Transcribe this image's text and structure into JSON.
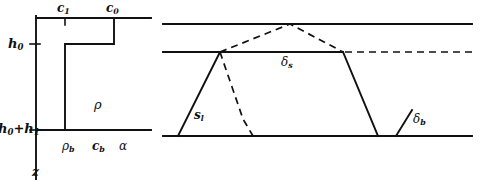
{
  "figure": {
    "kind": "scientific-line-diagram",
    "background_color": "#ffffff",
    "stroke_color": "#111111",
    "width_px": 484,
    "height_px": 185,
    "panels": [
      {
        "id": "left-profile-panel",
        "description": "vertical depth profile with stepped concentration curve"
      },
      {
        "id": "right-layer-panel",
        "description": "layered slab geometry with solid and dashed interface traces"
      }
    ]
  },
  "left_panel": {
    "labels": {
      "c1": "c",
      "c1_sub": "1",
      "c0": "c",
      "c0_sub": "0",
      "h0": "h",
      "h0_sub": "0",
      "h0h1": "h",
      "h0h1_sub0": "0",
      "h0h1_plus": "+h",
      "h0h1_sub1": "1",
      "rho": "ρ",
      "rho_b": "ρ",
      "rho_b_sub": "b",
      "c_b": "c",
      "c_b_sub": "b",
      "alpha": "α",
      "z_axis": "z"
    }
  },
  "right_panel": {
    "labels": {
      "delta_s": "δ",
      "delta_s_sub": "s",
      "delta_b": "δ",
      "delta_b_sub": "b",
      "s_l": "s",
      "s_l_sub": "l"
    }
  },
  "geometry": {
    "left": {
      "axis_x": 36,
      "axis_top_y": 18,
      "axis_bottom_y": 178,
      "top_rule_y": 18,
      "top_rule_x1": 36,
      "top_rule_x2": 150,
      "bottom_rule_y": 130,
      "bottom_rule_x1": 36,
      "bottom_rule_x2": 150,
      "step_c1_x": 65,
      "step_c0_x": 114,
      "step_h0_y": 44,
      "tick_h0_y": 44,
      "tick_h0h1_y": 130,
      "tick_c1_x": 65,
      "tick_c0_x": 114
    },
    "right": {
      "top_rule_y": 24,
      "mid_rule_y": 52,
      "bottom_rule_y": 136,
      "x_left": 163,
      "x_right": 472,
      "solid_peak_x": 220,
      "solid_plateau_x": 342,
      "dashed_peak_x": 290,
      "dashed_peak_y": 24,
      "solid_base_left_x": 178,
      "solid_base_right_x": 378,
      "dashed_base_right_x": 253,
      "tick_x1": 396,
      "tick_x2": 410
    }
  }
}
